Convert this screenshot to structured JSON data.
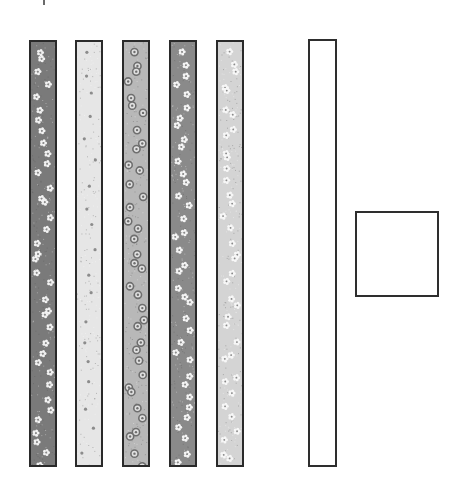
{
  "diagram": {
    "strips": [
      {
        "id": "strip-1",
        "pattern": "dark-speckle-white-flowers",
        "bg": "#7a7a7a",
        "motif": "#f2f2f2",
        "x": 29,
        "y": 40,
        "w": 28,
        "h": 427
      },
      {
        "id": "strip-2",
        "pattern": "light-speckle-grey-dots",
        "bg": "#e6e6e6",
        "motif": "#8c8c8c",
        "x": 75,
        "y": 40,
        "w": 28,
        "h": 427
      },
      {
        "id": "strip-3",
        "pattern": "mid-grey-ring-circles",
        "bg": "#b8b8b8",
        "motif": "#6e6e6e",
        "x": 122,
        "y": 40,
        "w": 28,
        "h": 427
      },
      {
        "id": "strip-4",
        "pattern": "dark-grey-white-flowers",
        "bg": "#8a8a8a",
        "motif": "#f5f5f5",
        "x": 169,
        "y": 40,
        "w": 28,
        "h": 427
      },
      {
        "id": "strip-5",
        "pattern": "pale-grey-white-flowers",
        "bg": "#d4d4d4",
        "motif": "#f7f7f7",
        "x": 216,
        "y": 40,
        "w": 28,
        "h": 427
      }
    ],
    "blank_strip": {
      "x": 308,
      "y": 39,
      "w": 29,
      "h": 428,
      "border": "#2e2e2e"
    },
    "blank_square": {
      "x": 355,
      "y": 211,
      "w": 84,
      "h": 86,
      "border": "#2e2e2e"
    }
  }
}
